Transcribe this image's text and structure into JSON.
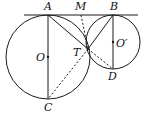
{
  "diagram": {
    "points": {
      "A": {
        "label": "A",
        "x": 48,
        "y": 15,
        "lx": 44,
        "ly": 10
      },
      "M": {
        "label": "M",
        "x": 81,
        "y": 15,
        "lx": 75,
        "ly": 10
      },
      "B": {
        "label": "B",
        "x": 113,
        "y": 15,
        "lx": 110,
        "ly": 10
      },
      "O": {
        "label": "O",
        "x": 48,
        "y": 57,
        "lx": 36,
        "ly": 61
      },
      "C": {
        "label": "C",
        "x": 48,
        "y": 99,
        "lx": 44,
        "ly": 111
      },
      "O_prime": {
        "label": "O′",
        "x": 113,
        "y": 42,
        "lx": 116,
        "ly": 47
      },
      "T": {
        "label": "T",
        "x": 88,
        "y": 49,
        "lx": 73,
        "ly": 56
      },
      "D": {
        "label": "D",
        "x": 113,
        "y": 69,
        "lx": 108,
        "ly": 80
      }
    },
    "circles": [
      {
        "name": "circle-O",
        "cx": 48,
        "cy": 57,
        "r": 42
      },
      {
        "name": "circle-O-prime",
        "cx": 113,
        "cy": 42,
        "r": 27
      }
    ],
    "tangent_line": {
      "x1": 24,
      "y1": 15,
      "x2": 138,
      "y2": 15
    },
    "solid_segments": [
      {
        "name": "segment-AC",
        "from": "A",
        "to": "C"
      },
      {
        "name": "segment-AT",
        "from": "A",
        "to": "T"
      },
      {
        "name": "segment-BT",
        "from": "B",
        "to": "T"
      },
      {
        "name": "segment-BD",
        "from": "B",
        "to": "D"
      }
    ],
    "dashed_segments": [
      {
        "name": "segment-MT",
        "from": "M",
        "to": "T"
      },
      {
        "name": "segment-TC",
        "from": "T",
        "to": "C"
      },
      {
        "name": "segment-TD",
        "from": "T",
        "to": "D"
      }
    ],
    "stroke_color": "#1a1a1a"
  }
}
